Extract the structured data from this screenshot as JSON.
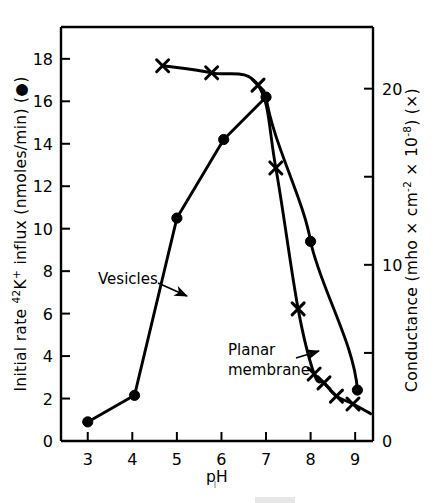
{
  "figure": {
    "background_color": "#ffffff",
    "ink_color": "#000000"
  },
  "axes": {
    "x": {
      "label": "pH",
      "ticks": [
        3,
        4,
        5,
        6,
        7,
        8,
        9
      ],
      "tick_labels": [
        "3",
        "4",
        "5",
        "6",
        "7",
        "8",
        "9"
      ],
      "range": [
        2.4,
        9.4
      ]
    },
    "y_left": {
      "label_prefix": "Initial rate ",
      "label_sup": "42",
      "label_mid": "K",
      "label_sup2": "+",
      "label_suffix": " influx (nmoles/min)  (",
      "label_marker": "●",
      "label_end": ")",
      "label_plain": "Initial rate 42K+ influx (nmoles/min) (●)",
      "ticks": [
        0,
        2,
        4,
        6,
        8,
        10,
        12,
        14,
        16,
        18
      ],
      "tick_labels": [
        "0",
        "2",
        "4",
        "6",
        "8",
        "10",
        "12",
        "14",
        "16",
        "18"
      ],
      "range": [
        0,
        19.5
      ]
    },
    "y_right": {
      "label_a": "Conductance  (mho",
      "label_times1": "×",
      "label_cm": "cm",
      "label_sup_m2": "-2",
      "label_times2": "×",
      "label_ten": "10",
      "label_sup_m8": "-8",
      "label_close": ")  (",
      "label_marker": "×",
      "label_end": ")",
      "label_plain": "Conductance (mho × cm⁻² × 10⁻⁸) (×)",
      "ticks": [
        0,
        5,
        10,
        15,
        20
      ],
      "labeled_ticks": [
        {
          "value": 0,
          "text": "0"
        },
        {
          "value": 10,
          "text": "10"
        },
        {
          "value": 20,
          "text": "20"
        }
      ],
      "range": [
        0,
        23.5
      ]
    }
  },
  "annotations": [
    {
      "name": "vesicles-label",
      "text": "Vesicles",
      "text_x": 98,
      "text_y": 284,
      "arrow": {
        "x1": 158,
        "y1": 283,
        "x2": 187,
        "y2": 296
      }
    },
    {
      "name": "planar-membrane-label",
      "line1": "Planar",
      "line2": "membrane",
      "text_x": 228,
      "text_y": 355,
      "arrow": {
        "x1": 296,
        "y1": 358,
        "x2": 319,
        "y2": 351
      }
    }
  ],
  "chart_data": {
    "type": "line",
    "title": "",
    "xlabel": "pH",
    "ylabel": "Initial rate 42K+ influx (nmoles/min)",
    "y2label": "Conductance (mho × cm⁻² × 10⁻⁸)",
    "xlim": [
      2.4,
      9.4
    ],
    "ylim": [
      0,
      19.5
    ],
    "y2lim": [
      0,
      23.5
    ],
    "grid": false,
    "legend": "inline-annotations",
    "series": [
      {
        "name": "Vesicles",
        "axis": "left",
        "marker": "filled-circle",
        "units": "nmoles/min",
        "x": [
          3.0,
          4.05,
          5.0,
          6.05,
          7.0,
          8.0,
          9.05
        ],
        "values": [
          0.9,
          2.15,
          10.5,
          14.2,
          16.2,
          9.4,
          2.4
        ]
      },
      {
        "name": "Planar membrane",
        "axis": "right",
        "marker": "cross",
        "units": "mho × cm⁻² × 10⁻⁸",
        "x": [
          4.68,
          5.78,
          6.82,
          7.22,
          7.72,
          8.08,
          8.3,
          8.58,
          8.95
        ],
        "values": [
          21.3,
          20.9,
          20.2,
          15.5,
          7.5,
          3.8,
          3.3,
          2.55,
          2.1
        ]
      }
    ]
  }
}
